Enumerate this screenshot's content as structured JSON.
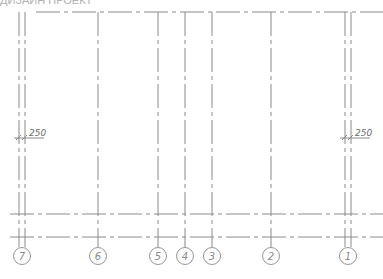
{
  "drawing": {
    "type": "structural grid plan (partial)",
    "top_caption_cut_off": "ДИЗАЙН ПРОЕКТ",
    "line_color": "#8a8a8a",
    "background": "#ffffff",
    "grid_axes": [
      {
        "label": "7",
        "x": 22,
        "double": true,
        "offsets": [
          19,
          25
        ]
      },
      {
        "label": "6",
        "x": 98,
        "double": false
      },
      {
        "label": "5",
        "x": 158,
        "double": false
      },
      {
        "label": "4",
        "x": 185,
        "double": false
      },
      {
        "label": "3",
        "x": 212,
        "double": false
      },
      {
        "label": "2",
        "x": 271,
        "double": false
      },
      {
        "label": "1",
        "x": 348,
        "double": true,
        "offsets": [
          345,
          351
        ]
      }
    ],
    "horizontal_lines_y": [
      12,
      214,
      237
    ],
    "dimensions": [
      {
        "text": "250",
        "x": 30,
        "y": 137,
        "side": "left"
      },
      {
        "text": "250",
        "x": 356,
        "y": 137,
        "side": "right"
      }
    ]
  }
}
